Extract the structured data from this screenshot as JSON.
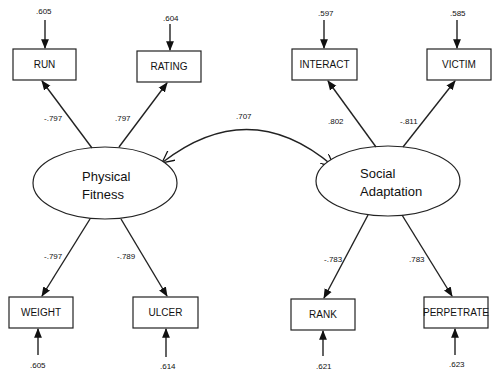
{
  "diagram": {
    "type": "structural-equation-model",
    "latent_factors": [
      {
        "id": "physical",
        "line1": "Physical",
        "line2": "Fitness"
      },
      {
        "id": "social",
        "line1": "Social",
        "line2": "Adaptation"
      }
    ],
    "correlation": {
      "between": [
        "physical",
        "social"
      ],
      "value": ".707"
    },
    "indicators": [
      {
        "name": "RUN",
        "factor": "physical",
        "loading": "-.797",
        "error": ".605"
      },
      {
        "name": "RATING",
        "factor": "physical",
        "loading": ".797",
        "error": ".604"
      },
      {
        "name": "WEIGHT",
        "factor": "physical",
        "loading": "-.797",
        "error": ".605"
      },
      {
        "name": "ULCER",
        "factor": "physical",
        "loading": "-.789",
        "error": ".614"
      },
      {
        "name": "INTERACT",
        "factor": "social",
        "loading": ".802",
        "error": ".597"
      },
      {
        "name": "VICTIM",
        "factor": "social",
        "loading": "-.811",
        "error": ".585"
      },
      {
        "name": "RANK",
        "factor": "social",
        "loading": "-.783",
        "error": ".621"
      },
      {
        "name": "PERPETRATE",
        "factor": "social",
        "loading": ".783",
        "error": ".623"
      }
    ]
  }
}
